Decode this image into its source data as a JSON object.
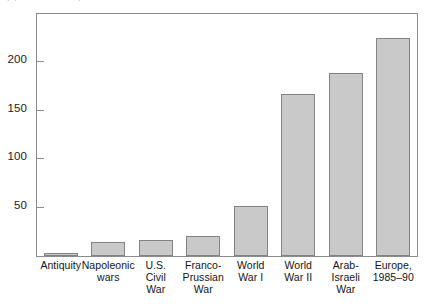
{
  "caption": {
    "text": "(b) Battle deaths per conflict"
  },
  "chart_data": {
    "type": "bar",
    "title": "",
    "subtitle": "",
    "xlabel": "",
    "ylabel": "",
    "categories": [
      "Antiquity",
      "Napoleonic\nwars",
      "U.S.\nCivil\nWar",
      "Franco-\nPrussian\nWar",
      "World\nWar I",
      "World\nWar II",
      "Arab-\nIsraeli\nWar",
      "Europe,\n1985–90"
    ],
    "values": [
      3,
      14,
      16,
      20,
      51,
      166,
      188,
      223
    ],
    "ylim": [
      0,
      248
    ],
    "yticks": [
      50,
      100,
      150,
      200
    ],
    "ytick_labels": [
      "50",
      "100",
      "150",
      "200"
    ],
    "grid": false,
    "legend": null,
    "bar_fill": "#c9c9c9",
    "bar_stroke": "#838383",
    "axis_color": "#8c8c8c",
    "background": "#ffffff"
  }
}
